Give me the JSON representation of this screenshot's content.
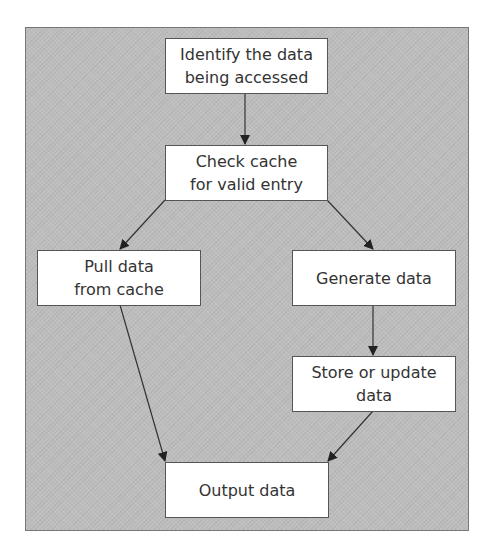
{
  "diagram": {
    "type": "flowchart",
    "background_color": "#bdbdbd",
    "nodes": [
      {
        "id": "identify",
        "label": "Identify the data\nbeing accessed"
      },
      {
        "id": "check",
        "label": "Check cache\nfor valid entry"
      },
      {
        "id": "pull",
        "label": "Pull data\nfrom cache"
      },
      {
        "id": "generate",
        "label": "Generate data"
      },
      {
        "id": "store",
        "label": "Store or update\ndata"
      },
      {
        "id": "output",
        "label": "Output data"
      }
    ],
    "edges": [
      {
        "from": "identify",
        "to": "check"
      },
      {
        "from": "check",
        "to": "pull"
      },
      {
        "from": "check",
        "to": "generate"
      },
      {
        "from": "generate",
        "to": "store"
      },
      {
        "from": "pull",
        "to": "output"
      },
      {
        "from": "store",
        "to": "output"
      }
    ]
  }
}
